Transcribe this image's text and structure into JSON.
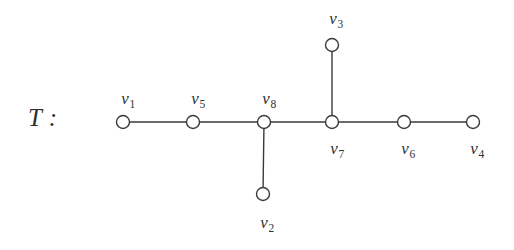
{
  "figure": {
    "title": "T :",
    "background_color": "#ffffff",
    "stroke_color": "#3a3a3a",
    "node_fill_color": "#ffffff",
    "text_color": "#313131",
    "width": 514,
    "height": 250
  },
  "chart_data": {
    "type": "diagram",
    "diagram_kind": "tree-graph",
    "title": "T :",
    "node_radius": 6.5,
    "nodes": [
      {
        "id": "v1",
        "label_base": "v",
        "label_sub": "1",
        "x": 123,
        "y": 122,
        "label_x": 128,
        "label_y": 90,
        "label_pos": "above"
      },
      {
        "id": "v5",
        "label_base": "v",
        "label_sub": "5",
        "x": 193,
        "y": 122,
        "label_x": 198,
        "label_y": 90,
        "label_pos": "above"
      },
      {
        "id": "v8",
        "label_base": "v",
        "label_sub": "8",
        "x": 264,
        "y": 122,
        "label_x": 269,
        "label_y": 90,
        "label_pos": "above"
      },
      {
        "id": "v7",
        "label_base": "v",
        "label_sub": "7",
        "x": 332,
        "y": 122,
        "label_x": 337,
        "label_y": 140,
        "label_pos": "below"
      },
      {
        "id": "v6",
        "label_base": "v",
        "label_sub": "6",
        "x": 404,
        "y": 122,
        "label_x": 408,
        "label_y": 140,
        "label_pos": "below"
      },
      {
        "id": "v4",
        "label_base": "v",
        "label_sub": "4",
        "x": 473,
        "y": 122,
        "label_x": 477,
        "label_y": 140,
        "label_pos": "below"
      },
      {
        "id": "v3",
        "label_base": "v",
        "label_sub": "3",
        "x": 332,
        "y": 45,
        "label_x": 336,
        "label_y": 10,
        "label_pos": "above"
      },
      {
        "id": "v2",
        "label_base": "v",
        "label_sub": "2",
        "x": 263,
        "y": 194,
        "label_x": 267,
        "label_y": 214,
        "label_pos": "below"
      }
    ],
    "edges": [
      {
        "from": "v1",
        "to": "v5"
      },
      {
        "from": "v5",
        "to": "v8"
      },
      {
        "from": "v8",
        "to": "v7"
      },
      {
        "from": "v7",
        "to": "v6"
      },
      {
        "from": "v6",
        "to": "v4"
      },
      {
        "from": "v7",
        "to": "v3"
      },
      {
        "from": "v8",
        "to": "v2"
      }
    ],
    "title_position": {
      "x": 28,
      "y": 105
    }
  }
}
